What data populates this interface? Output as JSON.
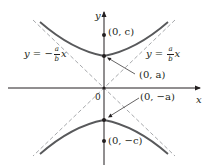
{
  "diagram": {
    "colors": {
      "axis": "#231f20",
      "curve": "#58595b",
      "asymptote": "#a7a9ac",
      "text": "#231f20"
    },
    "axes": {
      "x_label": "x",
      "y_label": "y",
      "origin_label": "0"
    },
    "points": {
      "focus_top": "(0, c)",
      "vertex_top": "(0, a)",
      "vertex_bottom": "(0, −a)",
      "focus_bottom": "(0, −c)"
    },
    "asymptotes": {
      "left": {
        "lhs": "y = −",
        "num": "a",
        "den": "b",
        "var": "x"
      },
      "right": {
        "lhs": "y = ",
        "num": "a",
        "den": "b",
        "var": "x"
      }
    }
  }
}
